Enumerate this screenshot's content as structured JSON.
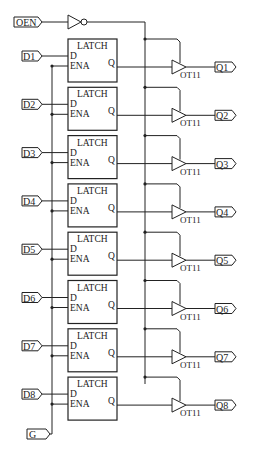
{
  "diagram": {
    "type": "circuit-schematic",
    "enable_input": {
      "label": "OEN"
    },
    "gate_input": {
      "label": "G"
    },
    "inverter": {
      "type": "NOT"
    },
    "latch": {
      "title": "LATCH",
      "pin_d": "D",
      "pin_ena": "ENA",
      "pin_q": "Q"
    },
    "buffer_label": "OT11",
    "inputs": [
      "D1",
      "D2",
      "D3",
      "D4",
      "D5",
      "D6",
      "D7",
      "D8"
    ],
    "outputs": [
      "Q1",
      "Q2",
      "Q3",
      "Q4",
      "Q5",
      "Q6",
      "Q7",
      "Q8"
    ],
    "colors": {
      "line": "#222222",
      "background": "#ffffff"
    }
  }
}
